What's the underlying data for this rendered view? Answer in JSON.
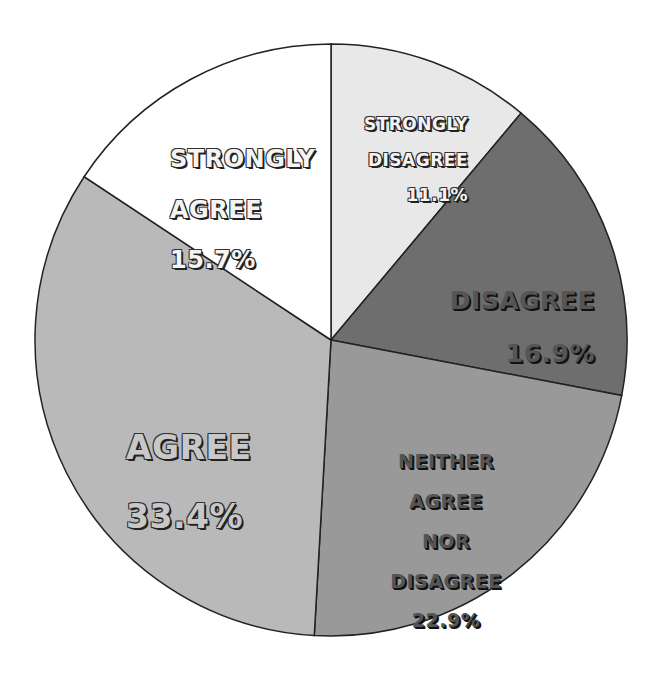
{
  "chart_data": {
    "type": "pie",
    "title": "",
    "start_angle_deg": 0,
    "direction": "clockwise",
    "slices": [
      {
        "label": "STRONGLY DISAGREE",
        "value": 11.1,
        "display": "11.1%",
        "color": "#e8e8e8"
      },
      {
        "label": "DISAGREE",
        "value": 16.9,
        "display": "16.9%",
        "color": "#6e6e6e"
      },
      {
        "label": "NEITHER AGREE NOR DISAGREE",
        "value": 22.9,
        "display": "22.9%",
        "color": "#999999"
      },
      {
        "label": "AGREE",
        "value": 33.4,
        "display": "33.4%",
        "color": "#b9b9b9"
      },
      {
        "label": "STRONGLY AGREE",
        "value": 15.7,
        "display": "15.7%",
        "color": "#ffffff"
      }
    ],
    "legend": "none (labels inside slices)"
  },
  "labels": {
    "strongly_disagree": {
      "line1": "STRONGLY",
      "line2": "DISAGREE",
      "pct": "11.1%"
    },
    "disagree": {
      "line1": "DISAGREE",
      "pct": "16.9%"
    },
    "neither": {
      "line1": "NEITHER",
      "line2": "AGREE",
      "line3": "NOR",
      "line4": "DISAGREE",
      "pct": "22.9%"
    },
    "agree": {
      "line1": "AGREE",
      "pct": "33.4%"
    },
    "strongly_agree": {
      "line1": "STRONGLY",
      "line2": "AGREE",
      "pct": "15.7%"
    }
  }
}
